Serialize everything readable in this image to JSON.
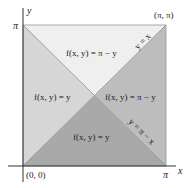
{
  "diagram": {
    "axes": {
      "x_label": "x",
      "y_label": "y",
      "x_tick_pi": "π",
      "y_tick_pi": "π",
      "origin_label": "(0, 0)",
      "corner_label": "(π, π)"
    },
    "regions": {
      "top": {
        "label": "f(x, y) = π − y",
        "color": "#efefef"
      },
      "left": {
        "label": "f(x, y) = y",
        "color": "#d6d6d6"
      },
      "right": {
        "label": "f(x, y) = π − y",
        "color": "#bdbdbd"
      },
      "bottom": {
        "label": "f(x, y) = y",
        "color": "#a9a9a9"
      }
    },
    "lines": {
      "diag_up": "y = x",
      "diag_down": "y = π − x"
    }
  }
}
